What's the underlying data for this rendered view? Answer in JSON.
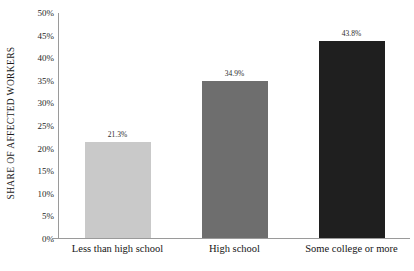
{
  "chart_data": {
    "type": "bar",
    "title": "",
    "subtitle": "",
    "xlabel": "",
    "ylabel": "SHARE OF AFFECTED WORKERS",
    "categories": [
      "Less than high school",
      "High school",
      "Some college or more"
    ],
    "values": [
      21.3,
      34.9,
      43.8
    ],
    "value_labels": [
      "21.3%",
      "34.9%",
      "43.8%"
    ],
    "series": [
      {
        "name": "Share of affected workers",
        "values": [
          21.3,
          34.9,
          43.8
        ]
      }
    ],
    "ylim": [
      0,
      50
    ],
    "ytick_values": [
      0,
      5,
      10,
      15,
      20,
      25,
      30,
      35,
      40,
      45,
      50
    ],
    "ytick_labels": [
      "0%",
      "5%",
      "10%",
      "15%",
      "20%",
      "25%",
      "30%",
      "35%",
      "40%",
      "45%",
      "50%"
    ],
    "grid": false,
    "legend": "none",
    "bar_colors": [
      "#c9c9c9",
      "#6e6e6e",
      "#1f1f1f"
    ],
    "axis_color": "#9a9a9a",
    "background_color": "#ffffff",
    "value_label_position": "above-bar"
  }
}
